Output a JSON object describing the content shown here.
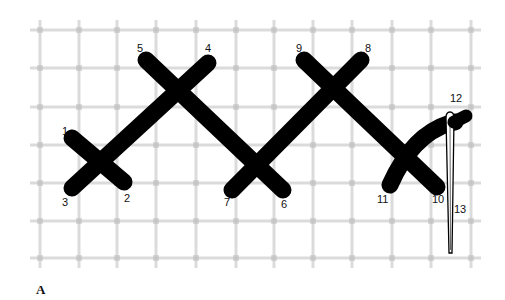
{
  "figure": {
    "caption": "A",
    "grid": {
      "x": [
        40,
        79,
        117,
        156,
        196,
        236,
        274,
        313,
        352,
        392,
        431,
        471
      ],
      "y": [
        30,
        68,
        107,
        145,
        183,
        221,
        258
      ],
      "color": "#cfcfcf"
    },
    "stitch_color": "#000000",
    "stitches": [
      {
        "from": "1",
        "to": "2",
        "x1": 72,
        "y1": 138,
        "x2": 124,
        "y2": 182
      },
      {
        "from": "3",
        "to": "4",
        "x1": 72,
        "y1": 188,
        "x2": 208,
        "y2": 63
      },
      {
        "from": "5",
        "to": "6",
        "x1": 146,
        "y1": 60,
        "x2": 283,
        "y2": 190
      },
      {
        "from": "7",
        "to": "8",
        "x1": 232,
        "y1": 190,
        "x2": 361,
        "y2": 60
      },
      {
        "from": "9",
        "to": "10",
        "x1": 304,
        "y1": 60,
        "x2": 437,
        "y2": 187
      },
      {
        "from": "11",
        "to": "12",
        "x1": 390,
        "y1": 185,
        "x2": 465,
        "y2": 118
      }
    ],
    "labels": [
      {
        "text": "1",
        "x": 62,
        "y": 135
      },
      {
        "text": "2",
        "x": 124,
        "y": 202
      },
      {
        "text": "3",
        "x": 62,
        "y": 206
      },
      {
        "text": "4",
        "x": 205,
        "y": 52
      },
      {
        "text": "5",
        "x": 137,
        "y": 52
      },
      {
        "text": "6",
        "x": 281,
        "y": 208
      },
      {
        "text": "7",
        "x": 224,
        "y": 206
      },
      {
        "text": "8",
        "x": 365,
        "y": 52
      },
      {
        "text": "9",
        "x": 296,
        "y": 52
      },
      {
        "text": "10",
        "x": 432,
        "y": 203
      },
      {
        "text": "11",
        "x": 377,
        "y": 203
      },
      {
        "text": "12",
        "x": 450,
        "y": 102
      },
      {
        "text": "13",
        "x": 454,
        "y": 213
      }
    ]
  }
}
